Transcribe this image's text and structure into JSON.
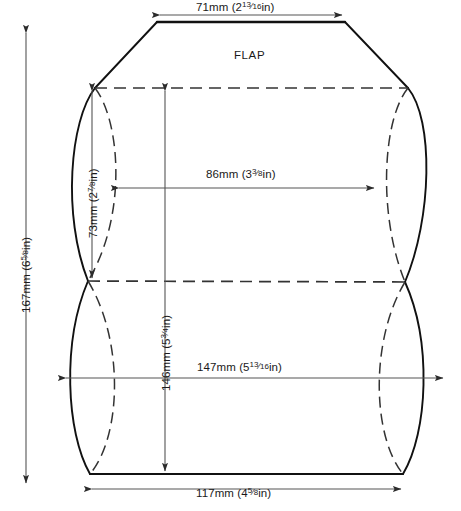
{
  "diagram": {
    "type": "dieline",
    "flap_label": "FLAP",
    "colors": {
      "outline": "#111111",
      "fold_dash": "#333333",
      "dimension": "#444444",
      "background": "#ffffff"
    },
    "dimensions": [
      {
        "id": "top-flap-width",
        "mm": "71mm",
        "inch_whole": "2",
        "inch_num": "13",
        "inch_den": "16",
        "text": "71mm (2¹³⁄₁₆in)",
        "orientation": "horizontal"
      },
      {
        "id": "overall-height",
        "mm": "167mm",
        "inch_whole": "6",
        "inch_num": "5",
        "inch_den": "8",
        "text": "167mm (6⁵⁄₈in)",
        "orientation": "vertical"
      },
      {
        "id": "flap-depth",
        "mm": "73mm",
        "inch_whole": "2",
        "inch_num": "7",
        "inch_den": "8",
        "text": "73mm (2⁷⁄₈in)",
        "orientation": "vertical"
      },
      {
        "id": "inner-width",
        "mm": "86mm",
        "inch_whole": "3",
        "inch_num": "3",
        "inch_den": "8",
        "text": "86mm (3³⁄₈in)",
        "orientation": "horizontal"
      },
      {
        "id": "body-height",
        "mm": "146mm",
        "inch_whole": "5",
        "inch_num": "3",
        "inch_den": "4",
        "text": "146mm (5³⁄₄in)",
        "orientation": "vertical"
      },
      {
        "id": "overall-width",
        "mm": "147mm",
        "inch_whole": "5",
        "inch_num": "13",
        "inch_den": "16",
        "text": "147mm (5¹³⁄₁₆in)",
        "orientation": "horizontal"
      },
      {
        "id": "bottom-width",
        "mm": "117mm",
        "inch_whole": "4",
        "inch_num": "5",
        "inch_den": "8",
        "text": "117mm (4⁵⁄₈in)",
        "orientation": "horizontal"
      }
    ]
  }
}
